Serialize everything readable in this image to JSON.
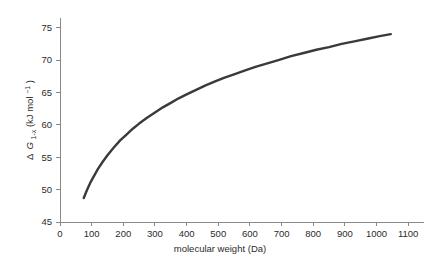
{
  "chart_data": {
    "type": "line",
    "title": "",
    "subtitle": "",
    "xlabel": "molecular weight (Da)",
    "ylabel": "Δ G1-x (kJ mol-1)",
    "ylabel_parts": {
      "delta": "Δ",
      "symbol": "G",
      "subscript": "1-x",
      "units": " (kJ mol",
      "superscript": "−1",
      "units_close": ")"
    },
    "xlim": [
      0,
      1150
    ],
    "ylim": [
      45,
      76.5
    ],
    "xticks": [
      0,
      100,
      200,
      300,
      400,
      500,
      600,
      700,
      800,
      900,
      1000,
      1100
    ],
    "xticklabels": [
      "0",
      "100",
      "200",
      "300",
      "400",
      "500",
      "600",
      "700",
      "800",
      "900",
      "1000",
      "1100"
    ],
    "yticks": [
      45,
      50,
      55,
      60,
      65,
      70,
      75
    ],
    "yticklabels": [
      "45",
      "50",
      "55",
      "60",
      "65",
      "70",
      "75"
    ],
    "grid": false,
    "legend": false,
    "legend_position": "none",
    "line_color": "#3a3a3a",
    "axis_color": "#8a8a8a",
    "background": "#ffffff",
    "series": [
      {
        "name": "free energy of transfer",
        "color": "#3a3a3a",
        "x": [
          75,
          85,
          95,
          105,
          120,
          135,
          150,
          170,
          190,
          210,
          230,
          250,
          275,
          300,
          325,
          350,
          375,
          400,
          430,
          460,
          490,
          520,
          550,
          585,
          620,
          655,
          690,
          730,
          770,
          810,
          850,
          890,
          930,
          970,
          1010,
          1045
        ],
        "y": [
          48.7,
          49.9,
          51.0,
          51.9,
          53.2,
          54.3,
          55.3,
          56.5,
          57.6,
          58.5,
          59.4,
          60.2,
          61.1,
          61.9,
          62.7,
          63.4,
          64.1,
          64.7,
          65.4,
          66.1,
          66.7,
          67.3,
          67.8,
          68.4,
          69.0,
          69.5,
          70.0,
          70.6,
          71.1,
          71.6,
          72.0,
          72.5,
          72.9,
          73.3,
          73.7,
          74.0
        ]
      }
    ]
  }
}
